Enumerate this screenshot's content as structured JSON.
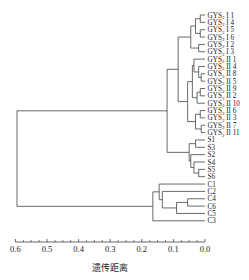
{
  "chart_data": {
    "type": "dendrogram",
    "title": "",
    "xlabel": "遗传距离",
    "ylabel": "",
    "xlim": [
      0.6,
      0.0
    ],
    "x_ticks": [
      "0.6",
      "0.5",
      "0.4",
      "0.3",
      "0.2",
      "0.1",
      "0.0"
    ],
    "leaves": [
      "GYS2 I1",
      "GYS2 I4",
      "GYS2 I5",
      "GYS2 I6",
      "GYS2 I2",
      "GYS2 I3",
      "GYS2 II1",
      "GYS2 II4",
      "GYS2 II8",
      "GYS2 II5",
      "GYS2 II9",
      "GYS2 II2",
      "GYS2 II10",
      "GYS2 II6",
      "GYS2 II3",
      "GYS2 II7",
      "GYS2 II11",
      "S1",
      "S3",
      "S2",
      "S4",
      "S5",
      "S6",
      "C1",
      "C2",
      "C4",
      "C6",
      "C5",
      "C3"
    ],
    "leaf_labels": [
      {
        "main": "GYS",
        "sub": "2",
        "rest": " I 1"
      },
      {
        "main": "GYS",
        "sub": "2",
        "rest": " I 4"
      },
      {
        "main": "GYS",
        "sub": "2",
        "rest": " I 5"
      },
      {
        "main": "GYS",
        "sub": "2",
        "rest": " I 6"
      },
      {
        "main": "GYS",
        "sub": "2",
        "rest": " I 2"
      },
      {
        "main": "GYS",
        "sub": "2",
        "rest": " I 3"
      },
      {
        "main": "GYS",
        "sub": "2",
        "rest": " II 1"
      },
      {
        "main": "GYS",
        "sub": "2",
        "rest": " II 4"
      },
      {
        "main": "GYS",
        "sub": "2",
        "rest": " II 8"
      },
      {
        "main": "GYS",
        "sub": "2",
        "rest": " II 5"
      },
      {
        "main": "GYS",
        "sub": "2",
        "rest": " II 9"
      },
      {
        "main": "GYS",
        "sub": "2",
        "rest": " II 2"
      },
      {
        "main": "GYS",
        "sub": "2",
        "rest": " II 10"
      },
      {
        "main": "GYS",
        "sub": "2",
        "rest": " II 6"
      },
      {
        "main": "GYS",
        "sub": "2",
        "rest": " II 3"
      },
      {
        "main": "GYS",
        "sub": "2",
        "rest": " II 7"
      },
      {
        "main": "GYS",
        "sub": "2",
        "rest": " II 11"
      },
      {
        "main": "S1"
      },
      {
        "main": "S3"
      },
      {
        "main": "S2"
      },
      {
        "main": "S4"
      },
      {
        "main": "S5"
      },
      {
        "main": "S6"
      },
      {
        "main": "C1"
      },
      {
        "main": "C2"
      },
      {
        "main": "C4"
      },
      {
        "main": "C6"
      },
      {
        "main": "C5"
      },
      {
        "main": "C3"
      }
    ],
    "merges_approx_distance": {
      "root (GYS+S vs C)": 0.595,
      "GYS_I+GYS_II vs S": 0.12,
      "GYS_I vs GYS_II": 0.085,
      "C cluster root": 0.165,
      "S cluster root": 0.05
    },
    "grid": false,
    "legend": null
  }
}
